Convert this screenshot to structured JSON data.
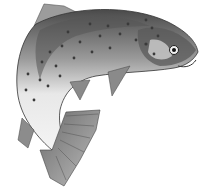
{
  "image": {
    "subject": "leaping trout illustration",
    "style": "grayscale engraving",
    "colors": {
      "background": "#ffffff",
      "body_light": "#e6e6e6",
      "body_mid": "#a8a8a8",
      "body_dark": "#505050",
      "spots": "#3a3a3a",
      "outline": "#2e2e2e"
    }
  }
}
